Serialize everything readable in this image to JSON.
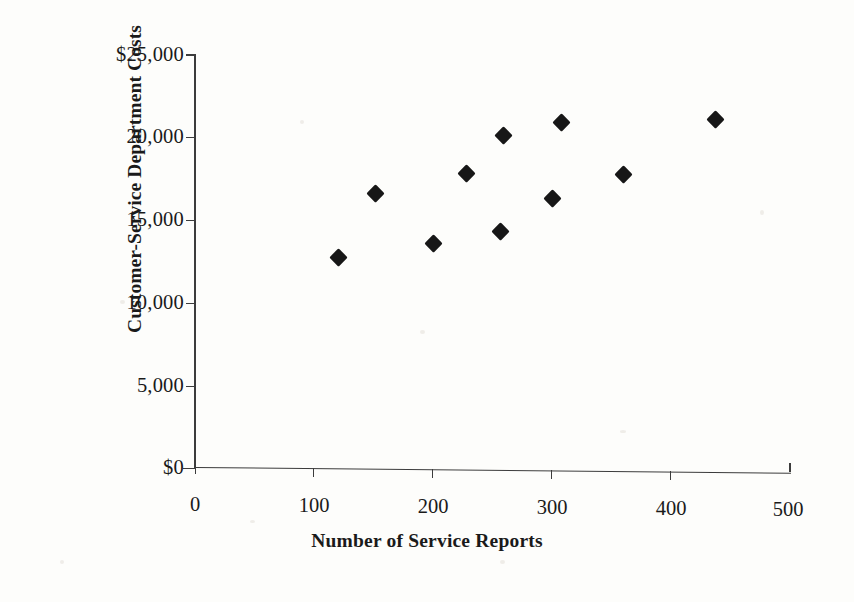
{
  "chart_data": {
    "type": "scatter",
    "title": "",
    "xlabel": "Number of Service Reports",
    "ylabel": "Customer-Service Department Costs",
    "xlim": [
      0,
      500
    ],
    "ylim": [
      0,
      25000
    ],
    "xticks": [
      "0",
      "100",
      "200",
      "300",
      "400",
      "500"
    ],
    "xtick_values": [
      0,
      100,
      200,
      300,
      400,
      500
    ],
    "yticks": [
      "$0",
      "5,000",
      "10,000",
      "15,000",
      "20,000",
      "$25,000"
    ],
    "ytick_values": [
      0,
      5000,
      10000,
      15000,
      20000,
      25000
    ],
    "grid": false,
    "legend": false,
    "marker": "filled-diamond",
    "marker_color": "#171717",
    "x": [
      121,
      152,
      200,
      228,
      257,
      259,
      300,
      308,
      360,
      437
    ],
    "y": [
      12800,
      16700,
      13700,
      18000,
      14500,
      20300,
      16500,
      21100,
      18000,
      21400
    ],
    "points": [
      {
        "x": 121,
        "y": 12800
      },
      {
        "x": 152,
        "y": 16700
      },
      {
        "x": 200,
        "y": 13700
      },
      {
        "x": 228,
        "y": 18000
      },
      {
        "x": 257,
        "y": 14500
      },
      {
        "x": 259,
        "y": 20300
      },
      {
        "x": 300,
        "y": 16500
      },
      {
        "x": 308,
        "y": 21100
      },
      {
        "x": 360,
        "y": 18000
      },
      {
        "x": 437,
        "y": 21400
      }
    ]
  },
  "axes": {
    "y_title": "Customer-Service Department Costs",
    "x_title": "Number of Service Reports",
    "y_tick_labels": [
      "$25,000",
      "20,000",
      "15,000",
      "10,000",
      "5,000",
      "$0"
    ],
    "x_tick_labels": [
      "0",
      "100",
      "200",
      "300",
      "400",
      "500"
    ]
  },
  "colors": {
    "marker": "#171717",
    "axis": "#3c3c3c",
    "background": "#fdfdfb"
  }
}
